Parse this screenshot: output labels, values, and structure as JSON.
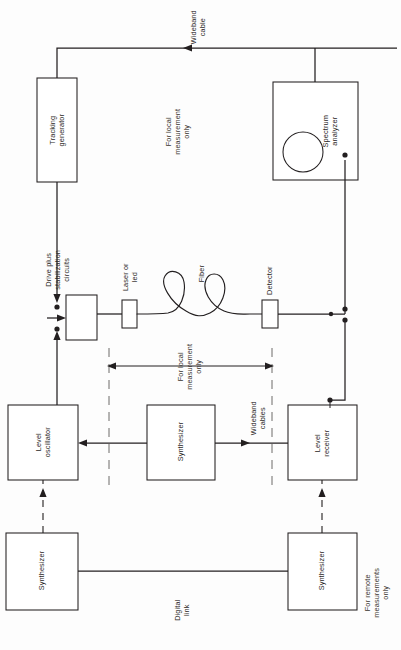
{
  "diagram": {
    "orientation": "rotated-90",
    "stroke_color": "#231f20",
    "background_color": "#fdfdfd",
    "blocks": [
      {
        "id": "tracking-generator",
        "label": "Tracking\ngenerator"
      },
      {
        "id": "spectrum-analyzer",
        "label": "Spectrum\nanalyzer"
      },
      {
        "id": "drive-circuits",
        "label": "Drive plus\nstabilization\ncircuits"
      },
      {
        "id": "laser-or-led",
        "label": "Laser or\nled"
      },
      {
        "id": "detector",
        "label": "Detector"
      },
      {
        "id": "level-oscillator",
        "label": "Level\noscillator"
      },
      {
        "id": "synthesizer-mid",
        "label": "Synthesizer"
      },
      {
        "id": "level-receiver",
        "label": "Level\nreceiver"
      },
      {
        "id": "synthesizer-left",
        "label": "Synthesizer"
      },
      {
        "id": "synthesizer-right",
        "label": "Synthesizer"
      }
    ],
    "annotations": [
      {
        "id": "wideband-cable",
        "label": "Wideband\ncable"
      },
      {
        "id": "for-local-measurement-only-top",
        "label": "For local\nmeasurement\nonly"
      },
      {
        "id": "fiber",
        "label": "Fiber"
      },
      {
        "id": "for-local-measurement-only-mid",
        "label": "For local\nmeasurement\nonly"
      },
      {
        "id": "wideband-cables",
        "label": "Wideband\ncables"
      },
      {
        "id": "digital-link",
        "label": "Digital\nlink"
      },
      {
        "id": "for-remote-measurements-only",
        "label": "For remote\nmeasurements\nonly"
      }
    ]
  },
  "labels": {
    "tracking_generator": "Tracking\ngenerator",
    "spectrum_analyzer": "Spectrum\nanalyzer",
    "drive_circuits": "Drive plus\nstabilization\ncircuits",
    "laser_or_led": "Laser or\nled",
    "detector": "Detector",
    "level_oscillator": "Level\noscillator",
    "synthesizer_mid": "Synthesizer",
    "level_receiver": "Level\nreceiver",
    "synthesizer_left": "Synthesizer",
    "synthesizer_right": "Synthesizer",
    "wideband_cable": "Wideband\ncable",
    "for_local_top": "For local\nmeasurement\nonly",
    "fiber": "Fiber",
    "for_local_mid": "For local\nmeasurement\nonly",
    "wideband_cables": "Wideband\ncables",
    "digital_link": "Digital\nlink",
    "for_remote": "For remote\nmeasurements\nonly"
  }
}
